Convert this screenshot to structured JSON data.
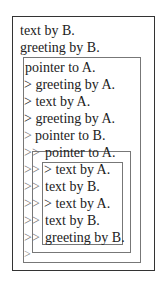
{
  "diagram": {
    "outer_lines": [
      "text by B.",
      "greeting by B."
    ],
    "box1": {
      "title": "pointer to A.",
      "lines": [
        "> greeting by A.",
        "> text by A.",
        "> greeting by A."
      ]
    },
    "box2": {
      "prefix": ">",
      "title": "pointer to B."
    },
    "box3": {
      "prefix": ">>",
      "title": "pointer to A.",
      "lines": [
        "> text by A.",
        "text by B.",
        "> text by A.",
        "text by B.",
        "greeting by B."
      ]
    },
    "trailing_prefix": ">",
    "prefixes": {
      "gt": ">",
      "gtgt": ">>"
    }
  }
}
